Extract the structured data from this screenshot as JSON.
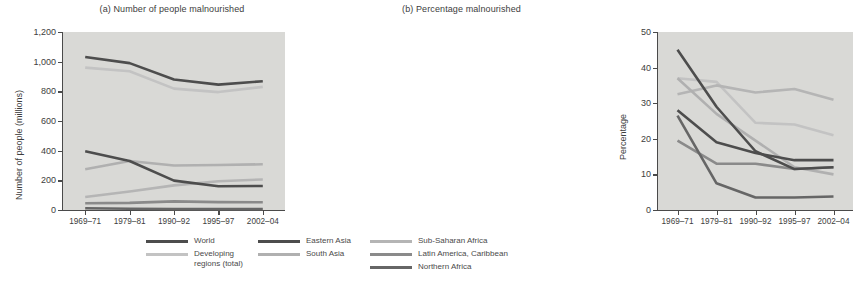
{
  "figure": {
    "panels": [
      {
        "id": "a",
        "title": "(a) Number of people malnourished",
        "ylabel": "Number of people (millions)"
      },
      {
        "id": "b",
        "title": "(b) Percentage malnourished",
        "ylabel": "Percentage"
      }
    ]
  },
  "legend": {
    "columns": [
      [
        {
          "label": "World",
          "color": "#4d4d4d"
        },
        {
          "label": "Developing\nregions (total)",
          "color": "#c3c3c3"
        }
      ],
      [
        {
          "label": "Eastern Asia",
          "color": "#4d4d4d"
        },
        {
          "label": "South Asia",
          "color": "#b0b0b0"
        }
      ],
      [
        {
          "label": "Sub-Saharan Africa",
          "color": "#b5b5b5"
        },
        {
          "label": "Latin America, Caribbean",
          "color": "#8a8a8a"
        },
        {
          "label": "Northern Africa",
          "color": "#666666"
        }
      ]
    ]
  },
  "chart_data": [
    {
      "type": "line",
      "panel": "a",
      "title": "(a) Number of people malnourished",
      "xlabel": "",
      "ylabel": "Number of people (millions)",
      "categories": [
        "1969–71",
        "1979–81",
        "1990–92",
        "1995–97",
        "2002–04"
      ],
      "ylim": [
        0,
        1200
      ],
      "yticks": [
        0,
        200,
        400,
        600,
        800,
        1000,
        1200
      ],
      "ytick_labels": [
        "0",
        "200",
        "400",
        "600",
        "800",
        "1,000",
        "1,200"
      ],
      "grid": false,
      "legend_position": "bottom",
      "series": [
        {
          "name": "World",
          "color": "#4d4d4d",
          "values": [
            1032,
            990,
            880,
            845,
            868
          ]
        },
        {
          "name": "Developing regions (total)",
          "color": "#c3c3c3",
          "values": [
            960,
            935,
            818,
            795,
            830
          ]
        },
        {
          "name": "Eastern Asia",
          "color": "#4d4d4d",
          "values": [
            396,
            330,
            198,
            160,
            162
          ]
        },
        {
          "name": "South Asia",
          "color": "#b0b0b0",
          "values": [
            275,
            330,
            300,
            303,
            308
          ]
        },
        {
          "name": "Sub-Saharan Africa",
          "color": "#b5b5b5",
          "values": [
            88,
            125,
            166,
            194,
            206
          ]
        },
        {
          "name": "Latin America, Caribbean",
          "color": "#8a8a8a",
          "values": [
            46,
            48,
            58,
            53,
            52
          ]
        },
        {
          "name": "Northern Africa",
          "color": "#666666",
          "values": [
            12,
            8,
            6,
            6,
            6
          ]
        }
      ]
    },
    {
      "type": "line",
      "panel": "b",
      "title": "(b) Percentage malnourished",
      "xlabel": "",
      "ylabel": "Percentage",
      "categories": [
        "1969–71",
        "1979–81",
        "1990–92",
        "1995–97",
        "2002–04"
      ],
      "ylim": [
        0,
        50
      ],
      "yticks": [
        0,
        10,
        20,
        30,
        40,
        50
      ],
      "ytick_labels": [
        "0",
        "10",
        "20",
        "30",
        "40",
        "50"
      ],
      "grid": false,
      "legend_position": "bottom",
      "series": [
        {
          "name": "World",
          "color": "#4d4d4d",
          "values": [
            28,
            19,
            16,
            14,
            14
          ]
        },
        {
          "name": "Developing regions (total)",
          "color": "#c3c3c3",
          "values": [
            37,
            36,
            24.5,
            24,
            21
          ]
        },
        {
          "name": "Eastern Asia",
          "color": "#4d4d4d",
          "values": [
            45,
            29,
            16.5,
            11.5,
            12
          ]
        },
        {
          "name": "South Asia",
          "color": "#b0b0b0",
          "values": [
            37,
            27,
            19.5,
            12,
            10
          ]
        },
        {
          "name": "Sub-Saharan Africa",
          "color": "#b5b5b5",
          "values": [
            32.5,
            35,
            33,
            34,
            31
          ]
        },
        {
          "name": "Latin America, Caribbean",
          "color": "#8a8a8a",
          "values": [
            19.5,
            13,
            13,
            11.5,
            12
          ]
        },
        {
          "name": "Northern Africa",
          "color": "#666666",
          "values": [
            26.5,
            7.5,
            3.5,
            3.5,
            3.8
          ]
        }
      ]
    }
  ]
}
